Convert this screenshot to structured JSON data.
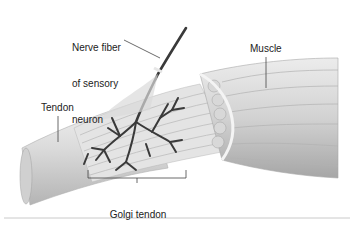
{
  "diagram": {
    "labels": {
      "nerve_fiber_line1": "Nerve fiber",
      "nerve_fiber_line2": "of sensory",
      "nerve_fiber_line3": "neuron",
      "muscle": "Muscle",
      "tendon": "Tendon",
      "golgi_line1": "Golgi tendon",
      "golgi_line2": "organ"
    },
    "colors": {
      "background": "#ffffff",
      "label_text": "#222222",
      "leader_line": "#444444",
      "nerve": "#3a3a3a",
      "tendon_light": "#e8e8e8",
      "tendon_mid": "#cfcfcf",
      "tendon_dark": "#a8a8a8",
      "muscle_light": "#e2e2e2",
      "muscle_dark": "#9a9a9a",
      "separator": "#bdbdbd"
    }
  }
}
